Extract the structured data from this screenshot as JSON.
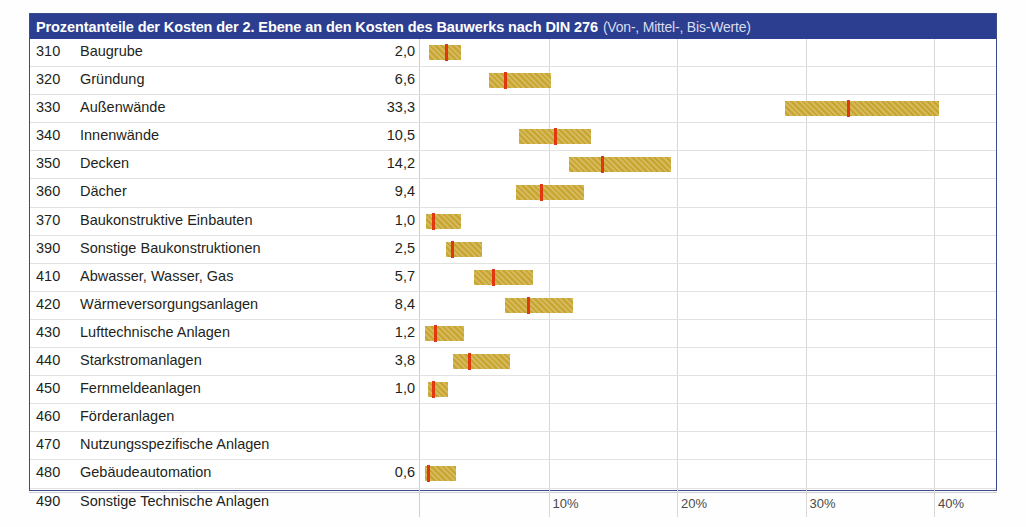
{
  "title": {
    "main": "Prozentanteile der Kosten der 2. Ebene an den Kosten des Bauwerks nach DIN 276",
    "sub": "(Von-, Mittel-, Bis-Werte)"
  },
  "colors": {
    "title_bar": "#2c3e8f",
    "bar_fill": "#c8a52e",
    "marker": "#e0380f",
    "grid": "#d8d8d8",
    "frame": "#3a4a8c"
  },
  "chart_data": {
    "type": "bar",
    "title": "Prozentanteile der Kosten der 2. Ebene an den Kosten des Bauwerks nach DIN 276 (Von-, Mittel-, Bis-Werte)",
    "xlabel": "",
    "ylabel": "",
    "xlim": [
      0,
      43
    ],
    "grid": true,
    "legend": "none",
    "xticks": [
      "10%",
      "20%",
      "30%",
      "40%"
    ],
    "xtick_values": [
      10,
      20,
      30,
      40
    ],
    "value_column_header": "",
    "rows": [
      {
        "code": "310",
        "label": "Baugrube",
        "value": "2,0",
        "mittel": 2.0,
        "von": 0.7,
        "bis": 3.2
      },
      {
        "code": "320",
        "label": "Gründung",
        "value": "6,6",
        "mittel": 6.6,
        "von": 5.4,
        "bis": 10.2
      },
      {
        "code": "330",
        "label": "Außenwände",
        "value": "33,3",
        "mittel": 33.3,
        "von": 28.4,
        "bis": 40.4
      },
      {
        "code": "340",
        "label": "Innenwände",
        "value": "10,5",
        "mittel": 10.5,
        "von": 7.7,
        "bis": 13.3
      },
      {
        "code": "350",
        "label": "Decken",
        "value": "14,2",
        "mittel": 14.2,
        "von": 11.6,
        "bis": 19.5
      },
      {
        "code": "360",
        "label": "Dächer",
        "value": "9,4",
        "mittel": 9.4,
        "von": 7.5,
        "bis": 12.8
      },
      {
        "code": "370",
        "label": "Baukonstruktive Einbauten",
        "value": "1,0",
        "mittel": 1.0,
        "von": 0.5,
        "bis": 3.2
      },
      {
        "code": "390",
        "label": "Sonstige Baukonstruktionen",
        "value": "2,5",
        "mittel": 2.5,
        "von": 2.0,
        "bis": 4.8
      },
      {
        "code": "410",
        "label": "Abwasser, Wasser, Gas",
        "value": "5,7",
        "mittel": 5.7,
        "von": 4.2,
        "bis": 8.8
      },
      {
        "code": "420",
        "label": "Wärmeversorgungsanlagen",
        "value": "8,4",
        "mittel": 8.4,
        "von": 6.6,
        "bis": 11.9
      },
      {
        "code": "430",
        "label": "Lufttechnische Anlagen",
        "value": "1,2",
        "mittel": 1.2,
        "von": 0.4,
        "bis": 3.4
      },
      {
        "code": "440",
        "label": "Starkstromanlagen",
        "value": "3,8",
        "mittel": 3.8,
        "von": 2.6,
        "bis": 7.0
      },
      {
        "code": "450",
        "label": "Fernmeldeanlagen",
        "value": "1,0",
        "mittel": 1.0,
        "von": 0.6,
        "bis": 2.2
      },
      {
        "code": "460",
        "label": "Förderanlagen",
        "value": "",
        "mittel": null,
        "von": null,
        "bis": null
      },
      {
        "code": "470",
        "label": "Nutzungsspezifische Anlagen",
        "value": "",
        "mittel": null,
        "von": null,
        "bis": null
      },
      {
        "code": "480",
        "label": "Gebäudeautomation",
        "value": "0,6",
        "mittel": 0.6,
        "von": 0.4,
        "bis": 2.8
      },
      {
        "code": "490",
        "label": "Sonstige Technische Anlagen",
        "value": "",
        "mittel": null,
        "von": null,
        "bis": null
      }
    ]
  }
}
